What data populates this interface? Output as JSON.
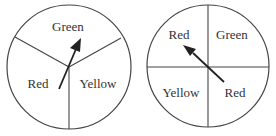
{
  "spinners": [
    {
      "name": "spinner-1",
      "sections": [
        {
          "label": "Green"
        },
        {
          "label": "Red"
        },
        {
          "label": "Yellow"
        }
      ],
      "arrow_points_to": "Green"
    },
    {
      "name": "spinner-2",
      "sections": [
        {
          "label": "Red"
        },
        {
          "label": "Green"
        },
        {
          "label": "Yellow"
        },
        {
          "label": "Red"
        }
      ],
      "arrow_points_to": "Red"
    }
  ],
  "colors": {
    "stroke": "#444444",
    "text": "#333333",
    "background": "#ffffff"
  }
}
